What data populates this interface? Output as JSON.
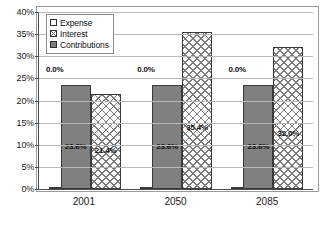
{
  "chart_data": {
    "type": "bar",
    "title": "",
    "subtitle": "",
    "xlabel": "",
    "ylabel": "",
    "categories": [
      "2001",
      "2050",
      "2085"
    ],
    "series": [
      {
        "name": "Expense",
        "values": [
          0.0,
          0.0,
          0.0
        ],
        "labels": [
          "0.0%",
          "0.0%",
          "0.0%"
        ],
        "fill": "white",
        "label_position": "above"
      },
      {
        "name": "Contributions",
        "values": [
          23.6,
          23.6,
          23.6
        ],
        "labels": [
          "23.6%",
          "23.6%",
          "23.6%"
        ],
        "fill": "solid-gray",
        "label_position": "inside"
      },
      {
        "name": "Interest",
        "values": [
          21.4,
          35.4,
          32.0
        ],
        "labels": [
          "21.4%",
          "35.4%",
          "32.0%"
        ],
        "fill": "crosshatch",
        "label_position": "inside"
      }
    ],
    "ylim": [
      0,
      40
    ],
    "ytick_values": [
      0,
      5,
      10,
      15,
      20,
      25,
      30,
      35,
      40
    ],
    "ytick_labels": [
      "0%",
      "5%",
      "10%",
      "15%",
      "20%",
      "25%",
      "30%",
      "35%",
      "40%"
    ],
    "grid": true,
    "grid_axis": "y",
    "legend_position": "top-left-inside",
    "legend_entries": [
      "Expense",
      "Interest",
      "Contributions"
    ],
    "annotations": []
  },
  "legend": {
    "items": [
      {
        "label": "Expense"
      },
      {
        "label": "Interest"
      },
      {
        "label": "Contributions"
      }
    ]
  },
  "axes": {
    "y": {
      "ticks": [
        {
          "label": "40%",
          "value": 40
        },
        {
          "label": "35%",
          "value": 35
        },
        {
          "label": "30%",
          "value": 30
        },
        {
          "label": "25%",
          "value": 25
        },
        {
          "label": "20%",
          "value": 20
        },
        {
          "label": "15%",
          "value": 15
        },
        {
          "label": "10%",
          "value": 10
        },
        {
          "label": "5%",
          "value": 5
        },
        {
          "label": "0%",
          "value": 0
        }
      ]
    },
    "x": {
      "ticks": [
        {
          "label": "2001"
        },
        {
          "label": "2050"
        },
        {
          "label": "2085"
        }
      ]
    }
  },
  "colors": {
    "contributions_fill": "#808080",
    "interest_hatch": "#7d7d7d",
    "expense_fill": "#ffffff",
    "gridline": "#b8b8b8",
    "axis": "#4d4d4d",
    "frame": "#9a9a9a",
    "text": "#111111"
  }
}
